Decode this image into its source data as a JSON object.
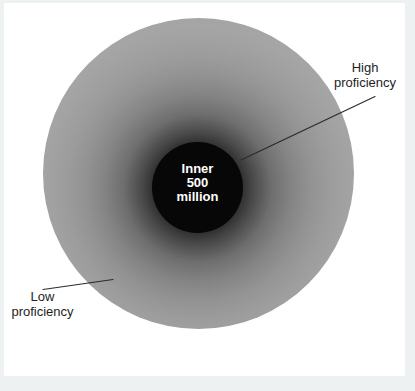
{
  "colors": {
    "frame_bg": "#eef1f2",
    "panel_bg": "#ffffff",
    "outer_gray": "#a5a5a5",
    "halo_dark": "#2a2a2a",
    "inner_circle_bg": "#070707",
    "inner_text": "#ffffff",
    "label_text": "#1e1e1e",
    "leader_line": "#2b2b2b"
  },
  "diagram": {
    "inner_circle": {
      "lines": [
        "Inner",
        "500",
        "million"
      ]
    },
    "annotations": {
      "high": {
        "lines": [
          "High",
          "proficiency"
        ]
      },
      "low": {
        "lines": [
          "Low",
          "proficiency"
        ]
      }
    }
  }
}
